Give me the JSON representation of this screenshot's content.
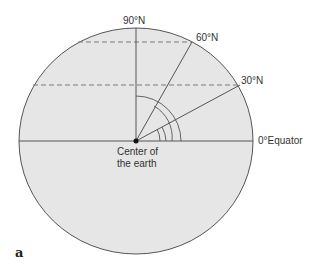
{
  "figure": {
    "panel_letter": "a",
    "colors": {
      "earth_fill": "#e6e6e6",
      "outline": "#555555",
      "lines": "#555555",
      "dashed": "#7a7a7a",
      "text": "#333333"
    },
    "labels": {
      "north_pole": "90°N",
      "lat60": "60°N",
      "lat30": "30°N",
      "equator": "0°Equator",
      "center_line1": "Center of",
      "center_line2": "the earth"
    },
    "angles_deg": [
      0,
      30,
      60,
      90
    ],
    "angle_arcs": 4
  }
}
